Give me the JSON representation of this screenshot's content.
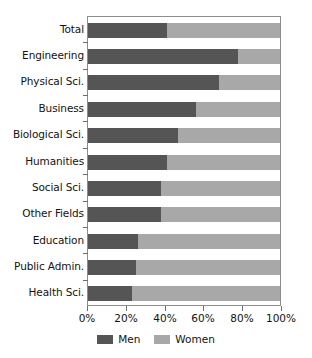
{
  "chart_data": {
    "type": "bar",
    "orientation": "horizontal",
    "stacked": true,
    "normalized": true,
    "title": "",
    "subtitle": "",
    "xlabel": "",
    "ylabel": "",
    "xlim": [
      0,
      100
    ],
    "xticks": [
      0,
      20,
      40,
      60,
      80,
      100
    ],
    "xticklabels": [
      "0%",
      "20%",
      "40%",
      "60%",
      "80%",
      "100%"
    ],
    "grid": false,
    "legend_position": "bottom-center",
    "categories": [
      "Total",
      "Engineering",
      "Physical Sci.",
      "Business",
      "Biological Sci.",
      "Humanities",
      "Social Sci.",
      "Other Fields",
      "Education",
      "Public Admin.",
      "Health Sci."
    ],
    "series": [
      {
        "name": "Men",
        "color": "#555555",
        "values": [
          41,
          78,
          68,
          56,
          47,
          41,
          38,
          38,
          26,
          25,
          23
        ]
      },
      {
        "name": "Women",
        "color": "#a8a8a8",
        "values": [
          59,
          22,
          32,
          44,
          53,
          59,
          62,
          62,
          74,
          75,
          77
        ]
      }
    ],
    "legend": [
      "Men",
      "Women"
    ]
  },
  "colors": {
    "men": "#555555",
    "women": "#a8a8a8",
    "axis": "#8d8d8d",
    "tick": "#6f6f6f",
    "text": "#121212",
    "background": "#ffffff"
  }
}
